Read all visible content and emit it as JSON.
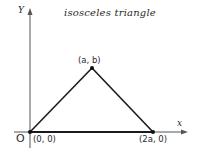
{
  "diagram": {
    "title": "isosceles triangle",
    "axes": {
      "x_label": "x",
      "y_label": "Y",
      "origin_label": "O"
    },
    "vertices": [
      {
        "name": "origin",
        "label": "(0, 0)"
      },
      {
        "name": "apex",
        "label": "(a, b)"
      },
      {
        "name": "base-right",
        "label": "(2a, 0)"
      }
    ],
    "colors": {
      "line": "#1a1a1a",
      "axis": "#555555",
      "text": "#2a2a2a",
      "background": "#ffffff"
    }
  }
}
